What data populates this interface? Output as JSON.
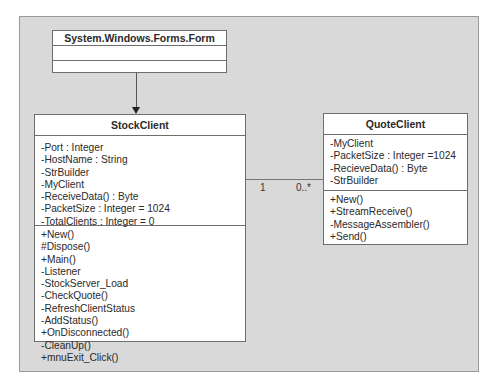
{
  "diagram": {
    "type": "UML class diagram",
    "classes": {
      "form": {
        "name": "System.Windows.Forms.Form",
        "attributes": [],
        "methods": []
      },
      "stock_client": {
        "name": "StockClient",
        "attributes": [
          "-Port : Integer",
          "-HostName : String",
          "-StrBuilder",
          "-MyClient",
          "-ReceiveData() : Byte",
          "-PacketSize : Integer = 1024",
          "-TotalClients : Integer = 0"
        ],
        "methods": [
          "+New()",
          "#Dispose()",
          "+Main()",
          "-Listener",
          "-StockServer_Load",
          "-CheckQuote()",
          "-RefreshClientStatus",
          "-AddStatus()",
          "+OnDisconnected()",
          "-CleanUp()",
          "+mnuExit_Click()"
        ]
      },
      "quote_client": {
        "name": "QuoteClient",
        "attributes": [
          "-MyClient",
          "-PacketSize : Integer =1024",
          "-RecieveData() : Byte",
          "-StrBuilder"
        ],
        "methods": [
          "+New()",
          "+StreamReceive()",
          "-MessageAssembler()",
          "+Send()"
        ]
      }
    },
    "relationships": [
      {
        "type": "inheritance",
        "from": "StockClient",
        "to": "System.Windows.Forms.Form"
      },
      {
        "type": "association",
        "from": "StockClient",
        "to": "QuoteClient",
        "source_multiplicity": "1",
        "target_multiplicity": "0..*"
      }
    ],
    "colors": {
      "background": "#d9d9d9",
      "class_fill": "#ffffff",
      "border": "#6e6e6e"
    }
  }
}
